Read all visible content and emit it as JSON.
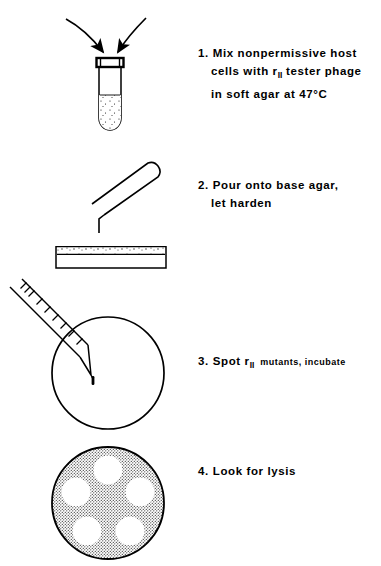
{
  "document": {
    "title": "rII spot test protocol",
    "background_color": "#ffffff",
    "ink_color": "#000000"
  },
  "steps": [
    {
      "number": "1.",
      "lines": [
        "Mix nonpermissive host",
        "cells with r_II tester phage",
        "in soft agar at 47°C"
      ],
      "line1": "Mix nonpermissive host",
      "line2_pre": "cells with r",
      "line2_sub": "II",
      "line2_post": " tester phage",
      "line3": "in soft agar at 47°C",
      "illustration": "test-tube-with-two-arrows"
    },
    {
      "number": "2.",
      "lines": [
        "Pour onto base agar,",
        "let harden"
      ],
      "line1": "Pour onto base agar,",
      "line2": "let harden",
      "illustration": "tilted-tube-pouring-onto-base-agar-side-view"
    },
    {
      "number": "3.",
      "lines": [
        "Spot r_II mutants, incubate"
      ],
      "main_pre": "Spot r",
      "main_sub": "II",
      "small_post": "mutants, incubate",
      "illustration": "pipette-spotting-drop-on-plate"
    },
    {
      "number": "4.",
      "lines": [
        "Look for lysis"
      ],
      "line1": "Look for lysis",
      "illustration": "plate-with-five-clear-lysis-zones"
    }
  ],
  "illustrations": {
    "test_tube": {
      "name": "test-tube",
      "arrows": 2,
      "liquid_fill": "stippled",
      "rim": "thick-dark-lip"
    },
    "pour_tube": {
      "name": "tilted-test-tube",
      "spout": "bent-lower-lip"
    },
    "base_agar_dish": {
      "name": "petri-dish-side-view",
      "agar_layer": "stippled-top-band"
    },
    "spot_plate": {
      "name": "petri-dish-top-view",
      "pipette": "graduated-pipette",
      "graduation_ticks": 8,
      "drop": 1
    },
    "lysis_plate": {
      "name": "petri-dish-lawn",
      "lawn_fill": "dotted-stipple",
      "clear_zones": 5
    }
  }
}
